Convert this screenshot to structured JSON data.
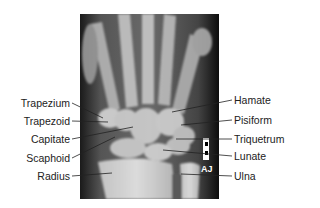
{
  "figure": {
    "marker_text": "AJ",
    "labels_left": [
      {
        "text": "Trapezium",
        "x": 70,
        "y": 103,
        "tx": 103,
        "ty": 118
      },
      {
        "text": "Trapezoid",
        "x": 70,
        "y": 121,
        "tx": 108,
        "ty": 122
      },
      {
        "text": "Capitate",
        "x": 70,
        "y": 139,
        "tx": 133,
        "ty": 127
      },
      {
        "text": "Scaphoid",
        "x": 70,
        "y": 158,
        "tx": 115,
        "ty": 137
      },
      {
        "text": "Radius",
        "x": 70,
        "y": 176,
        "tx": 112,
        "ty": 173
      }
    ],
    "labels_right": [
      {
        "text": "Hamate",
        "x": 234,
        "y": 100,
        "tx": 172,
        "ty": 112
      },
      {
        "text": "Pisiform",
        "x": 234,
        "y": 120,
        "tx": 181,
        "ty": 125
      },
      {
        "text": "Triquetrum",
        "x": 234,
        "y": 139,
        "tx": 176,
        "ty": 139
      },
      {
        "text": "Lunate",
        "x": 234,
        "y": 156,
        "tx": 163,
        "ty": 150
      },
      {
        "text": "Ulna",
        "x": 234,
        "y": 176,
        "tx": 181,
        "ty": 174
      }
    ]
  }
}
